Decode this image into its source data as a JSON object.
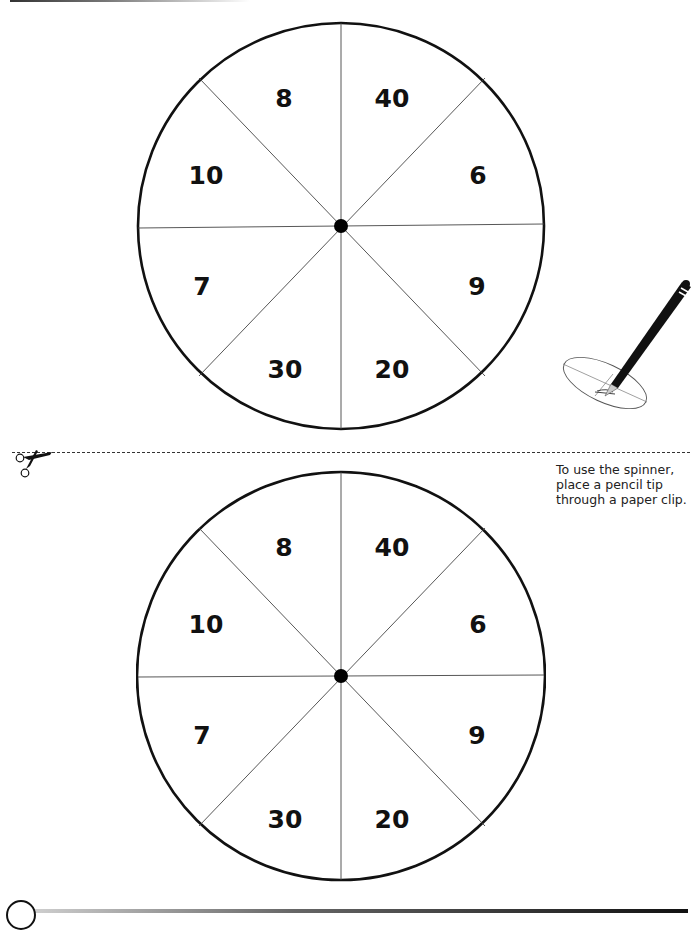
{
  "page": {
    "background": "#ffffff",
    "ink_color": "#111111"
  },
  "spinners": [
    {
      "id": "top",
      "sections": [
        {
          "position": "top-left",
          "value": "8"
        },
        {
          "position": "top-right",
          "value": "40"
        },
        {
          "position": "right-upper",
          "value": "6"
        },
        {
          "position": "right-lower",
          "value": "9"
        },
        {
          "position": "bottom-right",
          "value": "20"
        },
        {
          "position": "bottom-left",
          "value": "30"
        },
        {
          "position": "left-lower",
          "value": "7"
        },
        {
          "position": "left-upper",
          "value": "10"
        }
      ]
    },
    {
      "id": "bottom",
      "sections": [
        {
          "position": "top-left",
          "value": "8"
        },
        {
          "position": "top-right",
          "value": "40"
        },
        {
          "position": "right-upper",
          "value": "6"
        },
        {
          "position": "right-lower",
          "value": "9"
        },
        {
          "position": "bottom-right",
          "value": "20"
        },
        {
          "position": "bottom-left",
          "value": "30"
        },
        {
          "position": "left-lower",
          "value": "7"
        },
        {
          "position": "left-upper",
          "value": "10"
        }
      ]
    }
  ],
  "cut_line": {
    "icon": "scissors-icon",
    "style": "dashed"
  },
  "instructions": {
    "line1": "To use the spinner,",
    "line2": "place a pencil tip",
    "line3": "through a paper clip."
  },
  "illustration": {
    "icon": "pencil-paperclip-spinner-icon"
  }
}
